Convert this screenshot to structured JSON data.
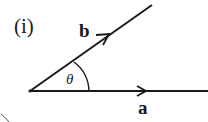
{
  "diagram": {
    "part_label": "(i)",
    "vectors": [
      {
        "name": "a",
        "label": "a",
        "direction": "horizontal"
      },
      {
        "name": "b",
        "label": "b",
        "direction": "inclined"
      }
    ],
    "angle_label": "θ",
    "stroke_color": "#1a1a1a"
  }
}
